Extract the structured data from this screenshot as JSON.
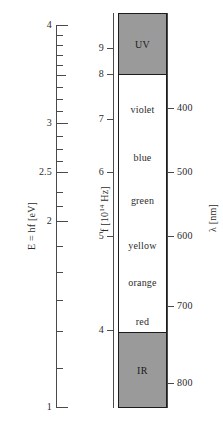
{
  "figure": {
    "colors": {
      "uv_ir_block": "#9a9a9a",
      "band_background": "#ffffff",
      "axis": "#4a4a4a",
      "outline": "#1c1c1c",
      "text": "#2b2b2b"
    }
  },
  "energy_axis": {
    "name": "energy-axis",
    "label": "E = hf [eV]",
    "unit": "eV",
    "symbol": "E = hf",
    "range": [
      1,
      4
    ],
    "labeled_ticks": [
      "4",
      "3",
      "2.5",
      "2",
      "1"
    ],
    "labeled_tick_values": [
      4,
      3,
      2.5,
      2,
      1
    ],
    "tick_values": [
      1,
      1.2,
      1.4,
      1.6,
      1.8,
      2,
      2.2,
      2.4,
      2.5,
      2.6,
      2.8,
      3,
      3.2,
      3.4,
      3.6,
      3.8,
      4
    ]
  },
  "frequency_axis": {
    "name": "frequency-axis",
    "label_prefix": "f [10",
    "label_exponent": "14",
    "label_suffix": " Hz]",
    "label_plain": "f [10^14 Hz]",
    "unit": "10^14 Hz",
    "symbol": "f",
    "labeled_ticks": [
      "9",
      "8",
      "7",
      "6",
      "5",
      "4"
    ],
    "labeled_tick_values": [
      9,
      8,
      7,
      6,
      5,
      4
    ],
    "range": [
      3.75,
      9.8
    ]
  },
  "wavelength_axis": {
    "name": "wavelength-axis",
    "label": "λ [nm]",
    "unit": "nm",
    "symbol": "λ",
    "labeled_ticks": [
      "400",
      "500",
      "600",
      "700",
      "800"
    ],
    "labeled_tick_values": [
      400,
      500,
      600,
      700,
      800
    ]
  },
  "spectrum": {
    "uv_band": {
      "label": "UV",
      "fill": "#9a9a9a",
      "frequency_range": [
        8.2,
        9.8
      ],
      "wavelength_range": [
        306,
        366
      ]
    },
    "ir_band": {
      "label": "IR",
      "fill": "#9a9a9a",
      "frequency_range": [
        3.75,
        4.0
      ],
      "wavelength_range": [
        750,
        840
      ]
    },
    "visible_colors": [
      {
        "label": "violet",
        "frequency": 7.5,
        "wavelength": 400
      },
      {
        "label": "blue",
        "frequency": 6.5,
        "wavelength": 470
      },
      {
        "label": "green",
        "frequency": 5.65,
        "wavelength": 530
      },
      {
        "label": "yellow",
        "frequency": 5.05,
        "wavelength": 595
      },
      {
        "label": "orange",
        "frequency": 4.75,
        "wavelength": 630
      },
      {
        "label": "red",
        "frequency": 4.3,
        "wavelength": 700
      }
    ]
  }
}
